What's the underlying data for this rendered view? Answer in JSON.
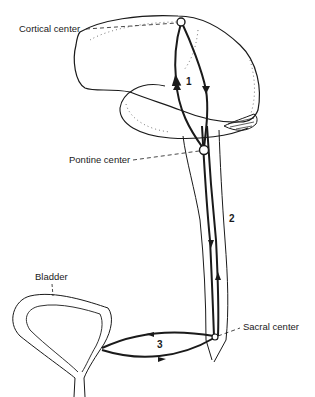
{
  "figure": {
    "type": "anatomical diagram"
  },
  "labels": {
    "cortical_center": "Cortical center",
    "pontine_center": "Pontine center",
    "sacral_center": "Sacral center",
    "bladder": "Bladder"
  },
  "loops": [
    {
      "number": "1",
      "connects": [
        "Cortical center",
        "Pontine center"
      ]
    },
    {
      "number": "2",
      "connects": [
        "Pontine center",
        "Sacral center"
      ]
    },
    {
      "number": "3",
      "connects": [
        "Sacral center",
        "Bladder"
      ]
    }
  ],
  "colors": {
    "ink": "#1a1a1a",
    "background": "#ffffff"
  }
}
